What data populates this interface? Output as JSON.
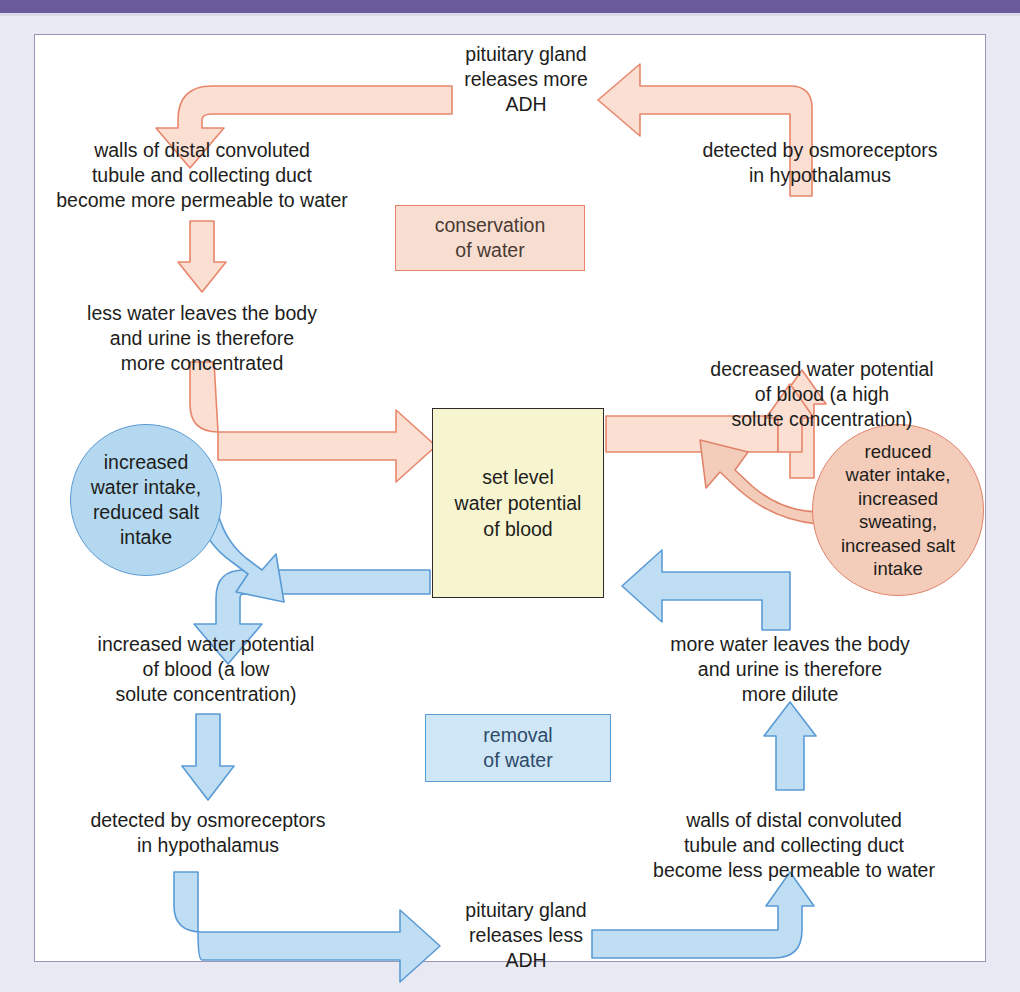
{
  "header": {
    "banner_color": "#6a5a9c"
  },
  "palette": {
    "orange_fill": "#fadfd2",
    "orange_stroke": "#e8866b",
    "blue_fill": "#bfdef4",
    "blue_stroke": "#5b9bd5",
    "center_fill": "#f7f4d0",
    "center_stroke": "#2b2b2b",
    "page_background": "#e9e9f3",
    "frame_border": "#9a93b8"
  },
  "diagram": {
    "center": {
      "label": "set level\nwater potential\nof blood"
    },
    "legends": [
      {
        "id": "conservation",
        "label": "conservation\nof water",
        "color": "#f7ded1"
      },
      {
        "id": "removal",
        "label": "removal\nof water",
        "color": "#cfe6f7"
      }
    ],
    "stimuli": [
      {
        "id": "blue-circle",
        "label": "increased\nwater intake,\nreduced salt\nintake",
        "color": "#b4d8ef"
      },
      {
        "id": "salmon-circle",
        "label": "reduced\nwater intake,\nincreased\nsweating,\nincreased salt\nintake",
        "color": "#f4cdba"
      }
    ],
    "conservation_pathway": [
      {
        "id": "decreased-water-potential",
        "label": "decreased water potential\nof blood (a high\nsolute concentration)"
      },
      {
        "id": "detected-osmoreceptors-high",
        "label": "detected by osmoreceptors\nin hypothalamus"
      },
      {
        "id": "pituitary-more-adh",
        "label": "pituitary gland\nreleases more\nADH"
      },
      {
        "id": "walls-more-permeable",
        "label": "walls of distal convoluted\ntubule and collecting duct\nbecome more permeable to water"
      },
      {
        "id": "less-water-leaves",
        "label": "less water leaves the body\nand urine is therefore\nmore concentrated"
      }
    ],
    "removal_pathway": [
      {
        "id": "increased-water-potential",
        "label": "increased water potential\nof blood (a low\nsolute concentration)"
      },
      {
        "id": "detected-osmoreceptors-low",
        "label": "detected by osmoreceptors\nin hypothalamus"
      },
      {
        "id": "pituitary-less-adh",
        "label": "pituitary gland\nreleases less\nADH"
      },
      {
        "id": "walls-less-permeable",
        "label": "walls of distal convoluted\ntubule and collecting duct\nbecome less permeable to water"
      },
      {
        "id": "more-water-leaves",
        "label": "more water leaves the body\nand urine is therefore\nmore dilute"
      }
    ]
  }
}
